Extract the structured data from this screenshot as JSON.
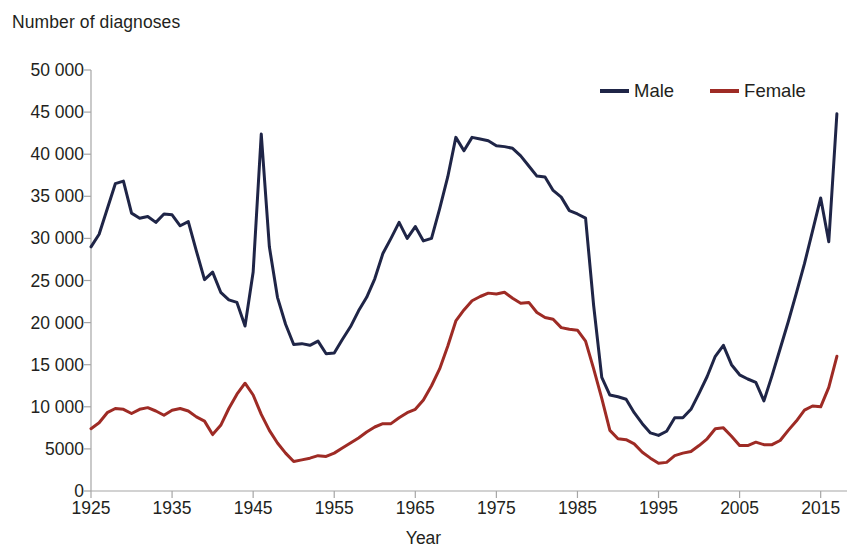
{
  "chart_data": {
    "type": "line",
    "title": "",
    "ylabel": "Number of diagnoses",
    "xlabel": "Year",
    "ylim": [
      0,
      50000
    ],
    "xlim": [
      1925,
      2018
    ],
    "grid": false,
    "legend_position": "top-right",
    "y_ticks": [
      0,
      5000,
      10000,
      15000,
      20000,
      25000,
      30000,
      35000,
      40000,
      45000,
      50000
    ],
    "y_tick_labels": [
      "0",
      "5000",
      "10 000",
      "15 000",
      "20 000",
      "25 000",
      "30 000",
      "35 000",
      "40 000",
      "45 000",
      "50 000"
    ],
    "x_ticks": [
      1925,
      1935,
      1945,
      1955,
      1965,
      1975,
      1985,
      1995,
      2005,
      2015
    ],
    "x_tick_labels": [
      "1925",
      "1935",
      "1945",
      "1955",
      "1965",
      "1975",
      "1985",
      "1995",
      "2005",
      "2015"
    ],
    "x": [
      1925,
      1926,
      1927,
      1928,
      1929,
      1930,
      1931,
      1932,
      1933,
      1934,
      1935,
      1936,
      1937,
      1938,
      1939,
      1940,
      1941,
      1942,
      1943,
      1944,
      1945,
      1946,
      1947,
      1948,
      1949,
      1950,
      1951,
      1952,
      1953,
      1954,
      1955,
      1956,
      1957,
      1958,
      1959,
      1960,
      1961,
      1962,
      1963,
      1964,
      1965,
      1966,
      1967,
      1968,
      1969,
      1970,
      1971,
      1972,
      1973,
      1974,
      1975,
      1976,
      1977,
      1978,
      1979,
      1980,
      1981,
      1982,
      1983,
      1984,
      1985,
      1986,
      1987,
      1988,
      1989,
      1990,
      1991,
      1992,
      1993,
      1994,
      1995,
      1996,
      1997,
      1998,
      1999,
      2000,
      2001,
      2002,
      2003,
      2004,
      2005,
      2006,
      2007,
      2008,
      2009,
      2010,
      2011,
      2012,
      2013,
      2014,
      2015,
      2016,
      2017
    ],
    "series": [
      {
        "name": "Male",
        "color": "#1F2547",
        "values": [
          29000,
          30500,
          33500,
          36500,
          36800,
          33000,
          32400,
          32600,
          31900,
          32900,
          32800,
          31500,
          32000,
          28500,
          25100,
          26000,
          23600,
          22700,
          22400,
          19600,
          26000,
          42400,
          29000,
          23000,
          19800,
          17400,
          17500,
          17300,
          17800,
          16300,
          16400,
          18000,
          19500,
          21400,
          23000,
          25200,
          28200,
          30000,
          31900,
          30000,
          31400,
          29700,
          30000,
          33500,
          37300,
          42000,
          40400,
          42000,
          41800,
          41600,
          41000,
          40900,
          40700,
          39800,
          38600,
          37400,
          37300,
          35700,
          34900,
          33300,
          32900,
          32400,
          22000,
          13500,
          11400,
          11200,
          10900,
          9300,
          8000,
          6900,
          6600,
          7100,
          8700,
          8700,
          9700,
          11600,
          13600,
          16000,
          17300,
          15000,
          13800,
          13300,
          12900,
          10700,
          13700,
          16900,
          20100,
          23500,
          27000,
          30900,
          34800,
          29600,
          44800
        ]
      },
      {
        "name": "Female",
        "color": "#9E2B25",
        "values": [
          7400,
          8100,
          9300,
          9800,
          9700,
          9200,
          9700,
          9900,
          9500,
          9000,
          9600,
          9800,
          9500,
          8800,
          8300,
          6700,
          7800,
          9800,
          11500,
          12800,
          11400,
          9100,
          7200,
          5700,
          4500,
          3500,
          3700,
          3900,
          4200,
          4100,
          4500,
          5100,
          5700,
          6300,
          7000,
          7600,
          8000,
          8000,
          8700,
          9300,
          9700,
          10800,
          12500,
          14500,
          17200,
          20200,
          21500,
          22600,
          23100,
          23500,
          23400,
          23600,
          22900,
          22300,
          22400,
          21200,
          20600,
          20400,
          19400,
          19200,
          19100,
          17800,
          14500,
          11000,
          7200,
          6200,
          6100,
          5600,
          4600,
          3900,
          3300,
          3400,
          4200,
          4500,
          4700,
          5400,
          6200,
          7400,
          7500,
          6500,
          5400,
          5400,
          5800,
          5500,
          5500,
          6000,
          7200,
          8300,
          9600,
          10100,
          10000,
          12300,
          16000
        ]
      }
    ]
  },
  "legend": {
    "entries": [
      {
        "label": "Male",
        "color": "#1F2547"
      },
      {
        "label": "Female",
        "color": "#9E2B25"
      }
    ]
  },
  "axes": {
    "y_title": "Number of diagnoses",
    "x_title": "Year",
    "axis_color": "#A6A6A6"
  }
}
